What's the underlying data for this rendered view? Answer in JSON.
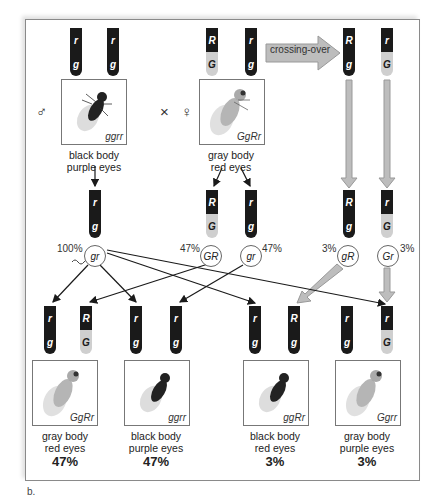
{
  "figure_label": "b.",
  "cross_symbol": "×",
  "male_symbol": "♂",
  "female_symbol": "♀",
  "crossing_over_label": "crossing-over",
  "parents": {
    "male": {
      "genotype": "ggrr",
      "phenotype_line1": "black body",
      "phenotype_line2": "purple eyes",
      "body": "black",
      "chromosomes": [
        {
          "top": "r",
          "bottom": "g"
        },
        {
          "top": "r",
          "bottom": "g"
        }
      ]
    },
    "female": {
      "genotype": "GgRr",
      "phenotype_line1": "gray body",
      "phenotype_line2": "red eyes",
      "body": "gray",
      "chromosomes": [
        {
          "top": "R",
          "bottom": "G"
        },
        {
          "top": "r",
          "bottom": "g"
        }
      ]
    }
  },
  "recombinant_chromosomes": [
    {
      "top": "R",
      "bottom": "g"
    },
    {
      "top": "r",
      "bottom": "G"
    }
  ],
  "gametes": [
    {
      "label": "gr",
      "percent": "100%",
      "source": "male",
      "type": "sperm"
    },
    {
      "label": "GR",
      "percent": "47%",
      "source": "female",
      "type": "parental"
    },
    {
      "label": "gr",
      "percent": "47%",
      "source": "female",
      "type": "parental"
    },
    {
      "label": "gR",
      "percent": "3%",
      "source": "female",
      "type": "recombinant"
    },
    {
      "label": "Gr",
      "percent": "3%",
      "source": "female",
      "type": "recombinant"
    }
  ],
  "offspring": [
    {
      "genotype": "GgRr",
      "phenotype_line1": "gray body",
      "phenotype_line2": "red eyes",
      "percent": "47%",
      "body": "gray",
      "chromosomes": [
        {
          "top": "r",
          "bottom": "g"
        },
        {
          "top": "R",
          "bottom": "G"
        }
      ]
    },
    {
      "genotype": "ggrr",
      "phenotype_line1": "black body",
      "phenotype_line2": "purple eyes",
      "percent": "47%",
      "body": "black",
      "chromosomes": [
        {
          "top": "r",
          "bottom": "g"
        },
        {
          "top": "r",
          "bottom": "g"
        }
      ]
    },
    {
      "genotype": "ggRr",
      "phenotype_line1": "black body",
      "phenotype_line2": "red eyes",
      "percent": "3%",
      "body": "black",
      "chromosomes": [
        {
          "top": "r",
          "bottom": "g"
        },
        {
          "top": "R",
          "bottom": "g"
        }
      ]
    },
    {
      "genotype": "Ggrr",
      "phenotype_line1": "gray body",
      "phenotype_line2": "purple eyes",
      "percent": "3%",
      "body": "gray",
      "chromosomes": [
        {
          "top": "r",
          "bottom": "g"
        },
        {
          "top": "r",
          "bottom": "G"
        }
      ]
    }
  ],
  "colors": {
    "chromosome_dark": "#1a1a1a",
    "chromosome_light": "#cfcfcf",
    "crossover_arrow": "#bdbdbd",
    "arrow_black": "#1a1a1a"
  }
}
